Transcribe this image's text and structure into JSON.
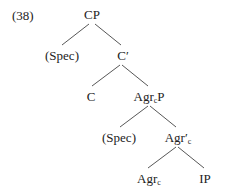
{
  "example_number": "(38)",
  "nodes": {
    "cp": {
      "main": "CP"
    },
    "spec1": {
      "main": "(Spec)"
    },
    "cbar": {
      "main": "C′"
    },
    "c": {
      "main": "C"
    },
    "agrcp": {
      "main": "Agr",
      "sub": "c",
      "tail": "P"
    },
    "spec2": {
      "main": "(Spec)"
    },
    "agrcbar": {
      "main": "Agr′",
      "sub": "c"
    },
    "agrc": {
      "main": "Agr",
      "sub": "c"
    },
    "ip": {
      "main": "IP"
    }
  },
  "edges": [
    [
      "CP",
      "(Spec)"
    ],
    [
      "CP",
      "C′"
    ],
    [
      "C′",
      "C"
    ],
    [
      "C′",
      "AgrcP"
    ],
    [
      "AgrcP",
      "(Spec)"
    ],
    [
      "AgrcP",
      "Agr′c"
    ],
    [
      "Agr′c",
      "Agrc"
    ],
    [
      "Agr′c",
      "IP"
    ]
  ]
}
